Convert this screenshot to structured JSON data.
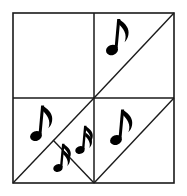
{
  "figure": {
    "title": "Square partitioned into triangles with music notes",
    "type": "geometric-diagram",
    "background_color": "#ffffff",
    "line_color": "#1a1a1a",
    "note_color": "#000000",
    "canvas": {
      "width": 187,
      "height": 196
    },
    "square": {
      "name": "outer-square",
      "left": 13,
      "top": 13,
      "right": 174,
      "bottom": 183,
      "stroke_width": 1.6
    },
    "dividers": [
      {
        "name": "vertical-midline",
        "x1": 94,
        "y1": 13,
        "x2": 94,
        "y2": 183
      },
      {
        "name": "horizontal-midline",
        "x1": 13,
        "y1": 98,
        "x2": 174,
        "y2": 98
      }
    ],
    "diagonals": [
      {
        "name": "diagonal-top-right-quadrant",
        "x1": 94,
        "y1": 98,
        "x2": 174,
        "y2": 13
      },
      {
        "name": "diagonal-bottom-left-quadrant",
        "x1": 13,
        "y1": 183,
        "x2": 94,
        "y2": 98
      },
      {
        "name": "diagonal-bottom-right-quadrant",
        "x1": 94,
        "y1": 183,
        "x2": 174,
        "y2": 98
      },
      {
        "name": "diagonal-inner-small-triangle",
        "x1": 53,
        "y1": 140,
        "x2": 94,
        "y2": 183
      }
    ],
    "quadrants": [
      {
        "name": "quadrant-top-left",
        "label": "top-left",
        "notes": 0,
        "subdivided": false
      },
      {
        "name": "quadrant-top-right",
        "label": "top-right",
        "notes": 1,
        "subdivided": true
      },
      {
        "name": "quadrant-bottom-left",
        "label": "bottom-left",
        "notes": 3,
        "subdivided": true
      },
      {
        "name": "quadrant-bottom-right",
        "label": "bottom-right",
        "notes": 1,
        "subdivided": true
      }
    ],
    "notes": [
      {
        "name": "note-top-right",
        "icon": "eighth-note-icon",
        "glyph": "♪",
        "type": "eighth",
        "flags": 1,
        "region": "top-right-upper-triangle",
        "x": 118,
        "y": 46,
        "size": 46,
        "rotation": 0
      },
      {
        "name": "note-bottom-left-upper",
        "icon": "eighth-note-icon",
        "glyph": "♪",
        "type": "eighth",
        "flags": 1,
        "region": "bottom-left-upper-triangle",
        "x": 42,
        "y": 131,
        "size": 44,
        "rotation": 0
      },
      {
        "name": "note-bottom-center-small",
        "icon": "sixteenth-note-icon",
        "glyph": "♬",
        "type": "sixteenth",
        "flags": 2,
        "region": "bottom-center-small-triangle",
        "x": 62,
        "y": 163,
        "size": 36,
        "rotation": 0
      },
      {
        "name": "note-bottom-center-right",
        "icon": "sixteenth-note-icon",
        "glyph": "♬",
        "type": "sixteenth",
        "flags": 2,
        "region": "bottom-left-lower-right-triangle",
        "x": 85,
        "y": 146,
        "size": 36,
        "rotation": 0
      },
      {
        "name": "note-bottom-right",
        "icon": "eighth-note-icon",
        "glyph": "♪",
        "type": "eighth",
        "flags": 1,
        "region": "bottom-right-upper-triangle",
        "x": 122,
        "y": 135,
        "size": 44,
        "rotation": 0
      }
    ],
    "summary": {
      "total_notes": 5,
      "eighth_notes": 3,
      "sixteenth_notes": 2
    }
  }
}
